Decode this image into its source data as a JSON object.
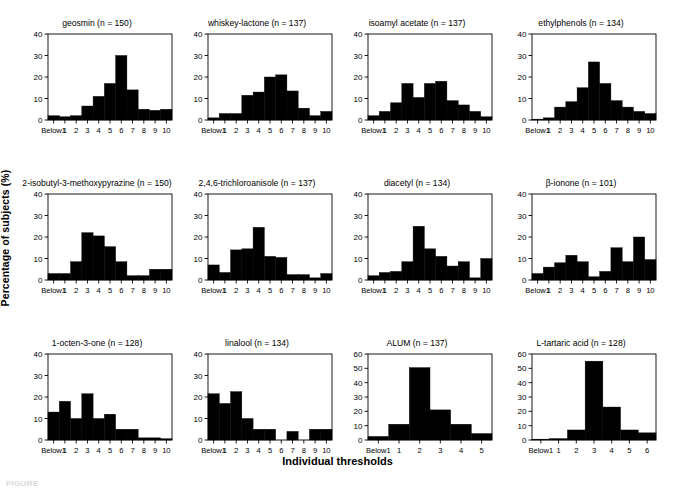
{
  "figure": {
    "ylabel": "Percentage of subjects (%)",
    "xlabel": "Individual thresholds",
    "footer": "FIGURE"
  },
  "chart_data": [
    {
      "type": "bar",
      "title": "geosmin (n = 150)",
      "panel": "geosmin",
      "n": 150,
      "categories": [
        "Below1",
        "1",
        "2",
        "3",
        "4",
        "5",
        "6",
        "7",
        "8",
        "9",
        "10"
      ],
      "values": [
        2,
        1.5,
        2,
        6.5,
        11,
        17,
        30,
        14,
        5,
        4.5,
        5
      ],
      "xlabel": "Individual thresholds",
      "ylabel": "Percentage of subjects (%)",
      "ylim": [
        0,
        40
      ],
      "yticks": [
        0,
        10,
        20,
        30,
        40
      ],
      "grid": false,
      "legend": "none"
    },
    {
      "type": "bar",
      "title": "whiskey-lactone (n = 137)",
      "panel": "whiskey-lactone",
      "n": 137,
      "categories": [
        "Below1",
        "1",
        "2",
        "3",
        "4",
        "5",
        "6",
        "7",
        "8",
        "9",
        "10"
      ],
      "values": [
        1,
        3,
        3,
        11.5,
        13,
        20,
        21,
        13.5,
        5.5,
        2,
        4
      ],
      "xlabel": "Individual thresholds",
      "ylabel": "Percentage of subjects (%)",
      "ylim": [
        0,
        40
      ],
      "yticks": [
        0,
        10,
        20,
        30,
        40
      ],
      "grid": false,
      "legend": "none"
    },
    {
      "type": "bar",
      "title": "isoamyl acetate (n = 137)",
      "panel": "isoamyl-acetate",
      "n": 137,
      "categories": [
        "Below1",
        "1",
        "2",
        "3",
        "4",
        "5",
        "6",
        "7",
        "8",
        "9",
        "10"
      ],
      "values": [
        2,
        4,
        8,
        17,
        10.5,
        17,
        18,
        9,
        7,
        4,
        1.5
      ],
      "xlabel": "Individual thresholds",
      "ylabel": "Percentage of subjects (%)",
      "ylim": [
        0,
        40
      ],
      "yticks": [
        0,
        10,
        20,
        30,
        40
      ],
      "grid": false,
      "legend": "none"
    },
    {
      "type": "bar",
      "title": "ethylphenols (n = 134)",
      "panel": "ethylphenols",
      "n": 134,
      "categories": [
        "Below1",
        "1",
        "2",
        "3",
        "4",
        "5",
        "6",
        "7",
        "8",
        "9",
        "10"
      ],
      "values": [
        0.4,
        1,
        6,
        8.5,
        15,
        27,
        17,
        9,
        6,
        4,
        3
      ],
      "xlabel": "Individual thresholds",
      "ylabel": "Percentage of subjects (%)",
      "ylim": [
        0,
        40
      ],
      "yticks": [
        0,
        10,
        20,
        30,
        40
      ],
      "grid": false,
      "legend": "none"
    },
    {
      "type": "bar",
      "title": "2-isobutyl-3-methoxypyrazine (n = 150)",
      "panel": "2-isobutyl-3-methoxypyrazine",
      "n": 150,
      "categories": [
        "Below1",
        "1",
        "2",
        "3",
        "4",
        "5",
        "6",
        "7",
        "8",
        "9",
        "10"
      ],
      "values": [
        3,
        3,
        8.5,
        22,
        20.5,
        15.5,
        8.5,
        2,
        2,
        5,
        5
      ],
      "xlabel": "Individual thresholds",
      "ylabel": "Percentage of subjects (%)",
      "ylim": [
        0,
        40
      ],
      "yticks": [
        0,
        10,
        20,
        30,
        40
      ],
      "grid": false,
      "legend": "none"
    },
    {
      "type": "bar",
      "title": "2,4,6-trichloroanisole (n = 137)",
      "panel": "2-4-6-trichloroanisole",
      "n": 137,
      "categories": [
        "Below1",
        "1",
        "2",
        "3",
        "4",
        "5",
        "6",
        "7",
        "8",
        "9",
        "10"
      ],
      "values": [
        7,
        3.5,
        14,
        14.5,
        24.5,
        11,
        10.5,
        2.5,
        2.5,
        1,
        3
      ],
      "xlabel": "Individual thresholds",
      "ylabel": "Percentage of subjects (%)",
      "ylim": [
        0,
        40
      ],
      "yticks": [
        0,
        10,
        20,
        30,
        40
      ],
      "grid": false,
      "legend": "none"
    },
    {
      "type": "bar",
      "title": "diacetyl (n = 134)",
      "panel": "diacetyl",
      "n": 134,
      "categories": [
        "Below1",
        "1",
        "2",
        "3",
        "4",
        "5",
        "6",
        "7",
        "8",
        "9",
        "10"
      ],
      "values": [
        2,
        3.5,
        4,
        8.5,
        25,
        14.5,
        11,
        6.5,
        8.5,
        1,
        10
      ],
      "xlabel": "Individual thresholds",
      "ylabel": "Percentage of subjects (%)",
      "ylim": [
        0,
        40
      ],
      "yticks": [
        0,
        10,
        20,
        30,
        40
      ],
      "grid": false,
      "legend": "none"
    },
    {
      "type": "bar",
      "title": "β-ionone (n = 101)",
      "panel": "beta-ionone",
      "n": 101,
      "categories": [
        "Below1",
        "1",
        "2",
        "3",
        "4",
        "5",
        "6",
        "7",
        "8",
        "9",
        "10"
      ],
      "values": [
        3,
        6,
        8,
        11.5,
        8.5,
        1.5,
        4,
        15,
        8.5,
        20,
        9.5
      ],
      "xlabel": "Individual thresholds",
      "ylabel": "Percentage of subjects (%)",
      "ylim": [
        0,
        40
      ],
      "yticks": [
        0,
        10,
        20,
        30,
        40
      ],
      "grid": false,
      "legend": "none"
    },
    {
      "type": "bar",
      "title": "1-octen-3-one (n = 128)",
      "panel": "1-octen-3-one",
      "n": 128,
      "categories": [
        "Below1",
        "1",
        "2",
        "3",
        "4",
        "5",
        "6",
        "7",
        "8",
        "9",
        "10"
      ],
      "values": [
        13,
        18,
        10,
        21.5,
        10,
        12,
        5,
        5,
        1,
        1,
        0.6
      ],
      "xlabel": "Individual thresholds",
      "ylabel": "Percentage of subjects (%)",
      "ylim": [
        0,
        40
      ],
      "yticks": [
        0,
        10,
        20,
        30,
        40
      ],
      "grid": false,
      "legend": "none"
    },
    {
      "type": "bar",
      "title": "linalool (n = 134)",
      "panel": "linalool",
      "n": 134,
      "categories": [
        "Below1",
        "1",
        "2",
        "3",
        "4",
        "5",
        "6",
        "7",
        "8",
        "9",
        "10"
      ],
      "values": [
        21.5,
        17,
        22.5,
        10,
        5,
        5,
        0,
        4,
        0,
        5,
        5
      ],
      "xlabel": "Individual thresholds",
      "ylabel": "Percentage of subjects (%)",
      "ylim": [
        0,
        40
      ],
      "yticks": [
        0,
        10,
        20,
        30,
        40
      ],
      "grid": false,
      "legend": "none"
    },
    {
      "type": "bar",
      "title": "ALUM (n = 137)",
      "panel": "alum",
      "n": 137,
      "categories": [
        "Below1",
        "1",
        "2",
        "3",
        "4",
        "5"
      ],
      "values": [
        2.5,
        11,
        50.5,
        21,
        11,
        4.5
      ],
      "xlabel": "Individual thresholds",
      "ylabel": "Percentage of subjects (%)",
      "ylim": [
        0,
        60
      ],
      "yticks": [
        0,
        10,
        20,
        30,
        40,
        50,
        60
      ],
      "grid": false,
      "legend": "none"
    },
    {
      "type": "bar",
      "title": "L-tartaric acid (n = 128)",
      "panel": "l-tartaric-acid",
      "n": 128,
      "categories": [
        "Below1",
        "1",
        "2",
        "3",
        "4",
        "5",
        "6"
      ],
      "values": [
        0.6,
        1,
        7,
        55,
        23,
        7,
        5
      ],
      "xlabel": "Individual thresholds",
      "ylabel": "Percentage of subjects (%)",
      "ylim": [
        0,
        60
      ],
      "yticks": [
        0,
        10,
        20,
        30,
        40,
        50,
        60
      ],
      "grid": false,
      "legend": "none"
    }
  ]
}
